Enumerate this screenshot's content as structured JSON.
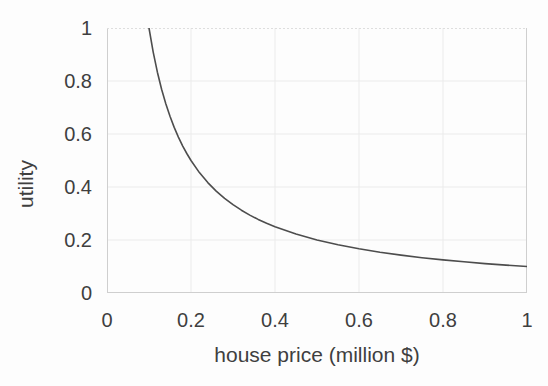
{
  "chart_data": {
    "type": "line",
    "title": "",
    "xlabel": "house price (million $)",
    "ylabel": "utility",
    "xlim": [
      0,
      1
    ],
    "ylim": [
      0,
      1
    ],
    "x_ticks": [
      0,
      0.2,
      0.4,
      0.6,
      0.8,
      1
    ],
    "y_ticks": [
      0,
      0.2,
      0.4,
      0.6,
      0.8,
      1
    ],
    "x_tick_labels": [
      "0",
      "0.2",
      "0.4",
      "0.6",
      "0.8",
      "1"
    ],
    "y_tick_labels": [
      "0",
      "0.2",
      "0.4",
      "0.6",
      "0.8",
      "1"
    ],
    "grid": true,
    "legend": false,
    "series": [
      {
        "name": "utility vs house price",
        "relation": "utility = 0.1 / price, for price in [0.1, 1]",
        "x": [
          0.1,
          0.11,
          0.12,
          0.13,
          0.14,
          0.15,
          0.16,
          0.17,
          0.18,
          0.19,
          0.2,
          0.22,
          0.24,
          0.26,
          0.28,
          0.3,
          0.32,
          0.34,
          0.36,
          0.38,
          0.4,
          0.45,
          0.5,
          0.55,
          0.6,
          0.65,
          0.7,
          0.75,
          0.8,
          0.85,
          0.9,
          0.95,
          1.0
        ],
        "y": [
          1.0,
          0.9091,
          0.8333,
          0.7692,
          0.7143,
          0.6667,
          0.625,
          0.5882,
          0.5556,
          0.5263,
          0.5,
          0.4545,
          0.4167,
          0.3846,
          0.3571,
          0.3333,
          0.3125,
          0.2941,
          0.2778,
          0.2632,
          0.25,
          0.2222,
          0.2,
          0.1818,
          0.1667,
          0.1538,
          0.1429,
          0.1333,
          0.125,
          0.1176,
          0.1111,
          0.1053,
          0.1
        ]
      }
    ],
    "colors": {
      "line": "#4d4d4d",
      "grid": "#ebebeb",
      "axis_box": "#cfcfcf",
      "top_border": "#dedede",
      "text": "#3f3f3f",
      "background": "#fdfdfd"
    }
  }
}
